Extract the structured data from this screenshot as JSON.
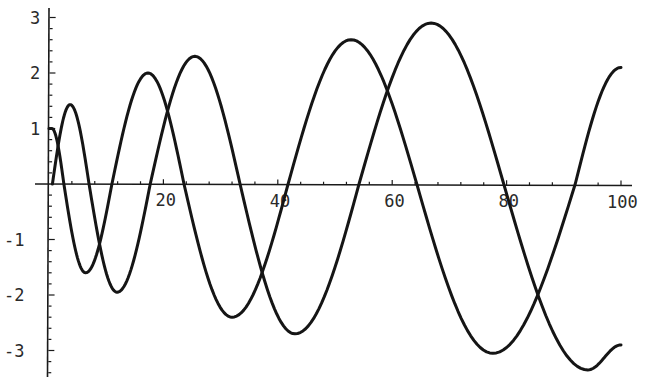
{
  "chart_data": {
    "type": "line",
    "title": "",
    "xlabel": "",
    "ylabel": "",
    "xlim": [
      0,
      100
    ],
    "ylim": [
      -3.4,
      3.1
    ],
    "grid": false,
    "legend": null,
    "x_ticks": [
      20,
      40,
      60,
      80,
      100
    ],
    "x_tick_labels": [
      "20",
      "40",
      "60",
      "80",
      "100"
    ],
    "x_minor_step": 4,
    "y_ticks": [
      3,
      2,
      1,
      -1,
      -2,
      -3
    ],
    "y_tick_labels": [
      "3",
      "2",
      "1",
      "-1",
      "-2",
      "-3"
    ],
    "y_minor_step": 0.2,
    "series": [
      {
        "name": "curve-a",
        "color": "#151515",
        "start_flat": [
          [
            0,
            1.0
          ],
          [
            0.5,
            1.0
          ]
        ],
        "key_points": [
          [
            0.5,
            1.0
          ],
          [
            2.6,
            0
          ],
          [
            6.4,
            -1.6
          ],
          [
            11.0,
            0
          ],
          [
            17.3,
            2.0
          ],
          [
            23.6,
            0
          ],
          [
            32.0,
            -2.4
          ],
          [
            41.8,
            0
          ],
          [
            52.8,
            2.6
          ],
          [
            64.3,
            0
          ],
          [
            77.6,
            -3.05
          ],
          [
            92.0,
            0
          ],
          [
            100,
            2.1
          ]
        ]
      },
      {
        "name": "curve-b",
        "color": "#151515",
        "key_points": [
          [
            0.6,
            0
          ],
          [
            3.7,
            1.43
          ],
          [
            7.0,
            0
          ],
          [
            11.9,
            -1.95
          ],
          [
            17.7,
            0
          ],
          [
            25.5,
            2.3
          ],
          [
            33.4,
            0
          ],
          [
            43.0,
            -2.7
          ],
          [
            54.2,
            0
          ],
          [
            66.8,
            2.9
          ],
          [
            79.5,
            0
          ],
          [
            94.2,
            -3.35
          ],
          [
            100,
            -2.9
          ]
        ]
      }
    ]
  }
}
